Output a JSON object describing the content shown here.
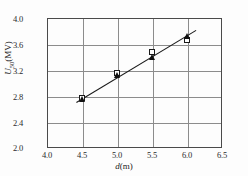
{
  "chart_data": {
    "type": "scatter",
    "title": "",
    "xlabel": "d(m)",
    "ylabel": "U50(MV)",
    "xlabel_parts": {
      "italic": "d",
      "plain": "(m)"
    },
    "ylabel_parts": {
      "italic": "U",
      "sub": "50",
      "plain": "(MV)"
    },
    "xlim": [
      4.0,
      6.5
    ],
    "ylim": [
      2.0,
      4.0
    ],
    "xticks": [
      4.0,
      4.5,
      5.0,
      5.5,
      6.0,
      6.5
    ],
    "yticks": [
      2.0,
      2.4,
      2.8,
      3.2,
      3.6,
      4.0
    ],
    "xtick_labels": [
      "4.0",
      "4.5",
      "5.0",
      "5.5",
      "6.0",
      "6.5"
    ],
    "ytick_labels": [
      "2.0",
      "2.4",
      "2.8",
      "3.2",
      "3.6",
      "4.0"
    ],
    "grid": true,
    "grid_color": "#8c8c8c",
    "frame_color": "#4a4a4a",
    "legend": "none",
    "x": [
      4.5,
      5.0,
      5.5,
      6.0
    ],
    "series": [
      {
        "name": "open-square",
        "marker": "square-open",
        "color": "#1a1a1a",
        "values": [
          2.77,
          3.16,
          3.47,
          3.66
        ]
      },
      {
        "name": "filled-triangle",
        "marker": "triangle-filled",
        "color": "#121212",
        "values": [
          2.76,
          3.13,
          3.4,
          3.72
        ]
      }
    ],
    "fit_line": {
      "type": "linear",
      "color": "#1a1a1a",
      "x_start": 4.42,
      "y_start": 2.7,
      "x_end": 6.13,
      "y_end": 3.81
    }
  },
  "axis": {
    "ytick_0": "2.0",
    "ytick_1": "2.4",
    "ytick_2": "2.8",
    "ytick_3": "3.2",
    "ytick_4": "3.6",
    "ytick_5": "4.0",
    "xtick_0": "4.0",
    "xtick_1": "4.5",
    "xtick_2": "5.0",
    "xtick_3": "5.5",
    "xtick_4": "6.0",
    "xtick_5": "6.5"
  }
}
